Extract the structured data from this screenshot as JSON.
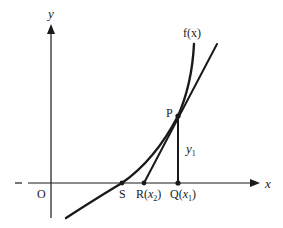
{
  "diagram": {
    "type": "newton-raphson-tangent",
    "axes": {
      "x_label": "x",
      "y_label": "y",
      "origin_label": "O"
    },
    "curve_label": "f(x)",
    "points": [
      {
        "name": "P",
        "label": "P"
      },
      {
        "name": "S",
        "label": "S"
      },
      {
        "name": "R",
        "label": "R",
        "sub_var": "x",
        "sub_index": "2"
      },
      {
        "name": "Q",
        "label": "Q",
        "sub_var": "x",
        "sub_index": "1"
      }
    ],
    "segment_label": {
      "var": "y",
      "index": "1"
    },
    "colors": {
      "ink": "#1a1a1a",
      "background": "#ffffff"
    }
  }
}
